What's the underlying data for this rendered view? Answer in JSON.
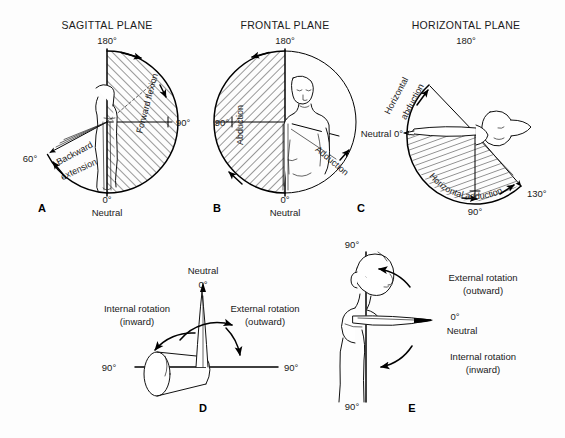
{
  "figure": {
    "background_color": "#fdfdfd",
    "ink_color": "#000000"
  },
  "panels": [
    {
      "letter": "A",
      "title": "SAGITTAL PLANE",
      "apex_label": "180°",
      "labels": {
        "right": "90°",
        "left": "60°",
        "bottom_deg": "0°",
        "bottom_word": "Neutral",
        "motion_forward": "Forward flexion",
        "motion_backward_line1": "Backward",
        "motion_backward_line2": "extension"
      }
    },
    {
      "letter": "B",
      "title": "FRONTAL PLANE",
      "apex_label": "180°",
      "labels": {
        "left": "90°",
        "bottom_deg": "0°",
        "bottom_word": "Neutral",
        "motion_abduction": "Abduction",
        "motion_adduction": "Adduction"
      }
    },
    {
      "letter": "C",
      "title": "HORIZONTAL PLANE",
      "apex_label": "180°",
      "labels": {
        "neutral": "Neutral 0°",
        "bottom": "90°",
        "lower_right": "130°",
        "motion_abduction_line1": "Horizontal",
        "motion_abduction_line2": "abduction",
        "motion_adduction": "Horizontal adduction"
      }
    },
    {
      "letter": "D",
      "labels": {
        "top_word": "Neutral",
        "top_deg": "0°",
        "left_deg": "90°",
        "right_deg": "90°",
        "internal_line1": "Internal rotation",
        "internal_line2": "(inward)",
        "external_line1": "External rotation",
        "external_line2": "(outward)"
      }
    },
    {
      "letter": "E",
      "labels": {
        "top_deg": "90°",
        "bottom_deg": "90°",
        "neutral_deg": "0°",
        "neutral_word": "Neutral",
        "external_line1": "External rotation",
        "external_line2": "(outward)",
        "internal_line1": "Internal rotation",
        "internal_line2": "(inward)"
      }
    }
  ]
}
